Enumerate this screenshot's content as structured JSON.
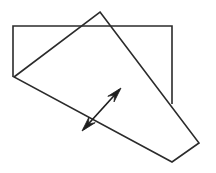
{
  "figure": {
    "title": "Overlapping rectangle and rotated quadrilateral with double-headed vector arrow",
    "background_color": "#ffffff",
    "stroke_color": "#2b2b2b",
    "arrow_color": "#1e1e1e",
    "canvas": {
      "width": 216,
      "height": 173
    }
  },
  "chart_data": {
    "type": "diagram",
    "title": "Overlapping rectangle and rotated quadrilateral with double-headed vector arrow",
    "xlabel": "",
    "ylabel": "",
    "xlim": [
      0,
      216
    ],
    "ylim": [
      0,
      173
    ],
    "grid": false,
    "legend": "none",
    "shapes": [
      {
        "name": "rectangle",
        "kind": "polyline",
        "closed": false,
        "note": "Axis-aligned rectangle, partially occluded; bottom edge not drawn, left and right edges terminate where the quadrilateral crosses them",
        "points": [
          [
            13,
            77
          ],
          [
            13,
            26
          ],
          [
            172,
            26
          ],
          [
            172,
            104
          ]
        ]
      },
      {
        "name": "quadrilateral",
        "kind": "polygon",
        "closed": true,
        "note": "Rotated four-sided plane overlapping the rectangle",
        "points": [
          [
            100,
            12
          ],
          [
            199,
            143
          ],
          [
            172,
            162
          ],
          [
            14,
            77
          ]
        ]
      }
    ],
    "annotations": [
      {
        "name": "normal-vector-arrow",
        "kind": "double-headed-arrow",
        "tail": [
          82,
          131
        ],
        "tip": [
          121,
          88
        ],
        "heads": [
          "tip",
          "tail"
        ],
        "note": "Double-headed arrow crossing the lower-left edge of the quadrilateral, indicating a normal direction"
      }
    ]
  }
}
